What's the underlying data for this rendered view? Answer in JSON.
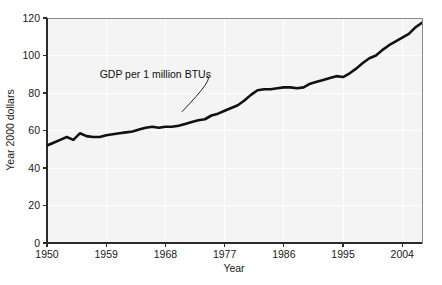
{
  "chart_data": {
    "type": "line",
    "title": "",
    "xlabel": "Year",
    "ylabel": "Year 2000 dollars",
    "xlim": [
      1950,
      2007
    ],
    "ylim": [
      0,
      120
    ],
    "grid": true,
    "legend_position": "none",
    "xticks": [
      "1950",
      "1959",
      "1968",
      "1977",
      "1986",
      "1995",
      "2004"
    ],
    "xtick_values": [
      1950,
      1959,
      1968,
      1977,
      1986,
      1995,
      2004
    ],
    "yticks": [
      "0",
      "20",
      "40",
      "60",
      "80",
      "100",
      "120"
    ],
    "ytick_values": [
      0,
      20,
      40,
      60,
      80,
      100,
      120
    ],
    "annotations": [
      {
        "text": "GDP per 1 million BTUs",
        "x": 1958,
        "y": 88,
        "points_to_x": 1970.5,
        "points_to_y": 70
      }
    ],
    "series": [
      {
        "name": "GDP per 1 million BTUs",
        "color": "#111111",
        "x": [
          1950,
          1951,
          1952,
          1953,
          1954,
          1955,
          1956,
          1957,
          1958,
          1959,
          1960,
          1961,
          1962,
          1963,
          1964,
          1965,
          1966,
          1967,
          1968,
          1969,
          1970,
          1971,
          1972,
          1973,
          1974,
          1975,
          1976,
          1977,
          1978,
          1979,
          1980,
          1981,
          1982,
          1983,
          1984,
          1985,
          1986,
          1987,
          1988,
          1989,
          1990,
          1991,
          1992,
          1993,
          1994,
          1995,
          1996,
          1997,
          1998,
          1999,
          2000,
          2001,
          2002,
          2003,
          2004,
          2005,
          2006,
          2007
        ],
        "values": [
          52.0,
          53.5,
          55.0,
          56.5,
          55.0,
          58.5,
          57.0,
          56.5,
          56.5,
          57.5,
          58.0,
          58.5,
          59.0,
          59.5,
          60.5,
          61.5,
          62.0,
          61.5,
          62.0,
          62.0,
          62.5,
          63.5,
          64.5,
          65.5,
          66.0,
          68.0,
          69.0,
          70.5,
          72.0,
          73.5,
          76.0,
          79.0,
          81.5,
          82.0,
          82.0,
          82.5,
          83.0,
          83.0,
          82.5,
          83.0,
          85.0,
          86.0,
          87.0,
          88.0,
          89.0,
          88.5,
          90.5,
          93.0,
          96.0,
          98.5,
          100.0,
          103.0,
          105.5,
          107.5,
          109.5,
          111.5,
          115.0,
          117.5
        ]
      }
    ]
  },
  "axis": {
    "x_title": "Year",
    "y_title": "Year 2000 dollars"
  }
}
